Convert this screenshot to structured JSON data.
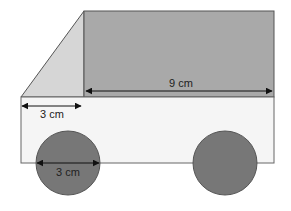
{
  "diagram": {
    "colors": {
      "cab_slope": "#d6d6d6",
      "cargo_box": "#a9a9a9",
      "body": "#f5f5f5",
      "wheel": "#777777",
      "outline": "#555555",
      "arrow": "#111111"
    },
    "labels": {
      "cargo_length": "9 cm",
      "body_offset": "3 cm",
      "wheel_diameter": "3 cm"
    }
  }
}
